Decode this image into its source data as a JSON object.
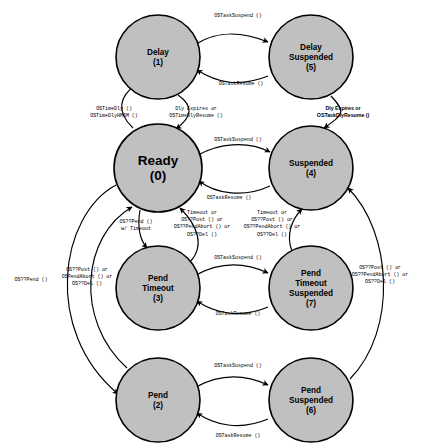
{
  "diagram": {
    "node_fill": "#c0c0c0",
    "node_stroke": "#000000",
    "background": "#ffffff",
    "nodes": [
      {
        "id": "delay",
        "line1": "Delay",
        "line2": "",
        "line3": "",
        "number": "(1)",
        "cx": 158,
        "cy": 57,
        "r": 42,
        "size": "small"
      },
      {
        "id": "delay_suspended",
        "line1": "Delay",
        "line2": "Suspended",
        "line3": "",
        "number": "(5)",
        "cx": 311,
        "cy": 57,
        "r": 42,
        "size": "small"
      },
      {
        "id": "ready",
        "line1": "Ready",
        "line2": "",
        "line3": "",
        "number": "(0)",
        "cx": 158,
        "cy": 168,
        "r": 44,
        "size": "big"
      },
      {
        "id": "suspended",
        "line1": "Suspended",
        "line2": "",
        "line3": "",
        "number": "(4)",
        "cx": 311,
        "cy": 168,
        "r": 42,
        "size": "small"
      },
      {
        "id": "pend_timeout",
        "line1": "Pend",
        "line2": "Timeout",
        "line3": "",
        "number": "(3)",
        "cx": 158,
        "cy": 288,
        "r": 42,
        "size": "small"
      },
      {
        "id": "pend_timeout_susp",
        "line1": "Pend",
        "line2": "Timeout",
        "line3": "Suspended",
        "number": "(7)",
        "cx": 311,
        "cy": 288,
        "r": 42,
        "size": "small"
      },
      {
        "id": "pend",
        "line1": "Pend",
        "line2": "",
        "line3": "",
        "number": "(2)",
        "cx": 158,
        "cy": 400,
        "r": 42,
        "size": "small"
      },
      {
        "id": "pend_suspended",
        "line1": "Pend",
        "line2": "Suspended",
        "line3": "",
        "number": "(6)",
        "cx": 311,
        "cy": 400,
        "r": 42,
        "size": "small"
      }
    ],
    "edge_labels": [
      {
        "id": "delay-suspend",
        "lines": [
          "OSTaskSuspend ()"
        ],
        "x": 238,
        "y": 17,
        "bold": false
      },
      {
        "id": "delay-resume",
        "lines": [
          "OSTaskResume ()"
        ],
        "x": 241,
        "y": 85,
        "bold": false
      },
      {
        "id": "ready-to-delay",
        "lines": [
          "OSTimeDly ()",
          "OSTimeDlyHMSM ()"
        ],
        "x": 114,
        "y": 110,
        "bold": false
      },
      {
        "id": "delay-to-ready",
        "lines": [
          "Dly Expires or",
          "OSTimeDlyResume ()"
        ],
        "x": 196,
        "y": 110,
        "bold": false
      },
      {
        "id": "dlysusp-to-susp",
        "lines": [
          "Dly Expires or",
          "OSTaskDlyResume ()"
        ],
        "x": 343,
        "y": 110,
        "bold": true
      },
      {
        "id": "ready-suspend",
        "lines": [
          "OSTaskSuspend ()"
        ],
        "x": 238,
        "y": 141,
        "bold": false
      },
      {
        "id": "ready-resume",
        "lines": [
          "OSTaskResume ()"
        ],
        "x": 229,
        "y": 199,
        "bold": false
      },
      {
        "id": "pend-w-timeout",
        "lines": [
          "OS??Pend ()",
          "w/ Timeout"
        ],
        "x": 136,
        "y": 223,
        "bold": false
      },
      {
        "id": "pendtmo-to-ready",
        "lines": [
          "Timeout or",
          "OS??Post () or",
          "OS??PendAbort () or",
          "OS??Del ()"
        ],
        "x": 202,
        "y": 214,
        "bold": false
      },
      {
        "id": "pendtmosusp-to-susp",
        "lines": [
          "Timeout or",
          "OS??Post () or",
          "OS??PendAbort () or",
          "OS??Del ()"
        ],
        "x": 272,
        "y": 214,
        "bold": false
      },
      {
        "id": "pendtmo-suspend",
        "lines": [
          "OSTaskSuspend ()"
        ],
        "x": 238,
        "y": 259,
        "bold": false
      },
      {
        "id": "pendtmo-resume",
        "lines": [
          "OSTaskResume ()"
        ],
        "x": 238,
        "y": 315,
        "bold": false
      },
      {
        "id": "ready-to-pend",
        "lines": [
          "OS??Pend ()"
        ],
        "x": 31,
        "y": 281,
        "bold": false
      },
      {
        "id": "pend-to-ready",
        "lines": [
          "OS??Post () or",
          "OSPendAbort () or",
          "OS??Del ()"
        ],
        "x": 87,
        "y": 271,
        "bold": false
      },
      {
        "id": "pendsusp-to-susp",
        "lines": [
          "OS??Post () or",
          "OS??PendAbort () or",
          "OS??Del ()"
        ],
        "x": 380,
        "y": 269,
        "bold": false
      },
      {
        "id": "pend-suspend",
        "lines": [
          "OSTaskSuspend ()"
        ],
        "x": 238,
        "y": 367,
        "bold": false
      },
      {
        "id": "pend-resume",
        "lines": [
          "OSTaskResume ()"
        ],
        "x": 238,
        "y": 437,
        "bold": false
      }
    ],
    "edges": [
      {
        "id": "delay-to-delaysusp",
        "d": "M 196 44 C 214 33 236 29 268 42",
        "arrow": true
      },
      {
        "id": "delaysusp-to-delay",
        "d": "M 268 76 C 238 88 216 82 197 70",
        "arrow": true
      },
      {
        "id": "ready-to-delay-edge",
        "d": "M 133 128 C 116 112 119 96 136 85",
        "arrow": true
      },
      {
        "id": "delay-to-ready-edge",
        "d": "M 178 95 C 194 106 192 117 176 129",
        "arrow": true
      },
      {
        "id": "delaysusp-to-susp-edge",
        "d": "M 331 96 C 346 112 344 114 324 128",
        "arrow": true
      },
      {
        "id": "ready-to-susp",
        "d": "M 198 155 C 218 144 246 140 270 152",
        "arrow": true
      },
      {
        "id": "susp-to-ready",
        "d": "M 270 186 C 244 198 216 194 199 181",
        "arrow": true
      },
      {
        "id": "ready-to-pendtmo",
        "d": "M 140 210 C 137 228 140 240 147 248",
        "arrow": true
      },
      {
        "id": "pendtmo-to-ready-edge",
        "d": "M 190 262 C 205 246 198 226 180 208",
        "arrow": true
      },
      {
        "id": "pendtmosusp-to-susp-edge",
        "d": "M 292 251 C 286 236 291 220 302 209",
        "arrow": true
      },
      {
        "id": "pendtmo-to-pendtmosusp",
        "d": "M 196 275 C 216 264 240 260 268 273",
        "arrow": true
      },
      {
        "id": "pendtmosusp-to-pendtmo",
        "d": "M 268 307 C 240 319 214 313 197 301",
        "arrow": true
      },
      {
        "id": "ready-to-pend-edge",
        "d": "M 116 185 C 60 215 42 330 118 394",
        "arrow": true
      },
      {
        "id": "pend-to-ready-edge",
        "d": "M 127 368 C 74 320 82 236 132 207",
        "arrow": true
      },
      {
        "id": "pendsusp-to-susp-edge",
        "d": "M 350 379 C 398 330 392 232 348 188",
        "arrow": true
      },
      {
        "id": "pend-to-pendsusp",
        "d": "M 196 387 C 216 376 240 372 268 385",
        "arrow": true
      },
      {
        "id": "pendsusp-to-pend",
        "d": "M 268 419 C 240 431 214 425 197 413",
        "arrow": true
      }
    ]
  }
}
